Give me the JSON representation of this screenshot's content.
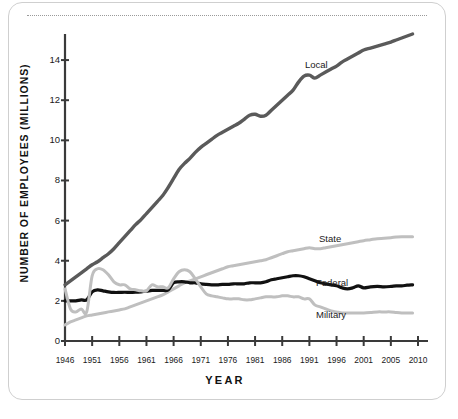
{
  "figure": {
    "axis_title_y": "NUMBER OF EMPLOYEES (MILLIONS)",
    "axis_title_x": "YEAR"
  },
  "chart_data": {
    "type": "line",
    "title": "",
    "xlabel": "YEAR",
    "ylabel": "NUMBER OF EMPLOYEES (MILLIONS)",
    "xlim": [
      1946,
      2010
    ],
    "ylim": [
      0,
      15
    ],
    "grid": false,
    "legend_position": "inline-right-of-lines",
    "x_ticks": [
      1946,
      1951,
      1956,
      1961,
      1966,
      1971,
      1976,
      1981,
      1986,
      1991,
      1996,
      2001,
      2005,
      2010
    ],
    "x_tick_labels": [
      "1946",
      "1951",
      "1956",
      "1961",
      "1966",
      "1971",
      "1976",
      "1981",
      "1986",
      "1991",
      "1996",
      "2001",
      "2005",
      "2010"
    ],
    "y_ticks": [
      0,
      2,
      4,
      6,
      8,
      10,
      12,
      14
    ],
    "y_tick_labels": [
      "0",
      "2",
      "4",
      "6",
      "8",
      "10",
      "12",
      "14"
    ],
    "colors": {
      "local": "#5a5a5a",
      "state": "#bfbfbf",
      "federal": "#111111",
      "military": "#bfbfbf",
      "axis": "#3a3a3a",
      "border": "#cfcfcf",
      "dotted_rule": "#9a9a9a"
    },
    "x": [
      1946,
      1947,
      1948,
      1949,
      1950,
      1951,
      1952,
      1953,
      1954,
      1955,
      1956,
      1957,
      1958,
      1959,
      1960,
      1961,
      1962,
      1963,
      1964,
      1965,
      1966,
      1967,
      1968,
      1969,
      1970,
      1971,
      1972,
      1973,
      1974,
      1975,
      1976,
      1977,
      1978,
      1979,
      1980,
      1981,
      1982,
      1983,
      1984,
      1985,
      1986,
      1987,
      1988,
      1989,
      1990,
      1991,
      1992,
      1993,
      1994,
      1995,
      1996,
      1997,
      1998,
      1999,
      2000,
      2001,
      2002,
      2003,
      2004,
      2005,
      2006,
      2007,
      2008,
      2009
    ],
    "series": [
      {
        "name": "Local",
        "color": "#5a5a5a",
        "label_text": "Local",
        "values": [
          2.8,
          3.0,
          3.2,
          3.4,
          3.6,
          3.75,
          3.9,
          4.1,
          4.3,
          4.6,
          4.9,
          5.2,
          5.5,
          5.75,
          6.0,
          6.3,
          6.6,
          6.9,
          7.2,
          7.6,
          8.1,
          8.5,
          8.8,
          9.0,
          9.4,
          9.6,
          9.8,
          10.0,
          10.2,
          10.4,
          10.6,
          10.7,
          10.9,
          11.1,
          11.3,
          11.3,
          11.2,
          11.2,
          11.4,
          11.7,
          12.0,
          12.3,
          12.6,
          13.0,
          13.4,
          13.5,
          13.6,
          13.7,
          13.9,
          14.1,
          14.3,
          14.6,
          14.8,
          15.1,
          15.4,
          15.7,
          16.0,
          16.2,
          16.4,
          16.7,
          16.9,
          17.1,
          17.3,
          17.5
        ],
        "axis_values_displayed": [
          2.8,
          3.0,
          3.2,
          3.4,
          3.6,
          3.8,
          3.95,
          4.15,
          4.35,
          4.6,
          4.9,
          5.2,
          5.5,
          5.8,
          6.05,
          6.35,
          6.65,
          6.95,
          7.25,
          7.65,
          8.1,
          8.55,
          8.85,
          9.1,
          9.4,
          9.65,
          9.85,
          10.05,
          10.25,
          10.4,
          10.55,
          10.7,
          10.85,
          11.05,
          11.25,
          11.3,
          11.2,
          11.25,
          11.5,
          11.75,
          12.0,
          12.25,
          12.5,
          12.9,
          13.2,
          13.25,
          13.1,
          13.25,
          13.4,
          13.55,
          13.7,
          13.9,
          14.05,
          14.2,
          14.35,
          14.5,
          14.6,
          14.7,
          14.8,
          14.9,
          15.0,
          15.1,
          15.2,
          15.3
        ]
      },
      {
        "name": "State",
        "color": "#bfbfbf",
        "label_text": "State",
        "values": [
          0.8,
          0.95,
          1.05,
          1.15,
          1.25,
          1.3,
          1.35,
          1.4,
          1.45,
          1.5,
          1.55,
          1.6,
          1.7,
          1.8,
          1.9,
          2.0,
          2.1,
          2.2,
          2.3,
          2.45,
          2.6,
          2.75,
          2.9,
          3.0,
          3.1,
          3.2,
          3.3,
          3.4,
          3.5,
          3.6,
          3.7,
          3.75,
          3.8,
          3.85,
          3.9,
          3.95,
          4.0,
          4.05,
          4.15,
          4.25,
          4.35,
          4.45,
          4.5,
          4.55,
          4.6,
          4.65,
          4.6,
          4.6,
          4.65,
          4.7,
          4.75,
          4.8,
          4.85,
          4.9,
          4.95,
          5.0,
          5.05,
          5.1,
          5.12,
          5.15,
          5.18,
          5.2,
          5.2,
          5.2
        ]
      },
      {
        "name": "Federal",
        "color": "#111111",
        "label_text": "Federal",
        "values": [
          2.0,
          2.0,
          2.0,
          2.05,
          2.05,
          2.45,
          2.55,
          2.5,
          2.45,
          2.42,
          2.42,
          2.43,
          2.42,
          2.43,
          2.45,
          2.48,
          2.52,
          2.52,
          2.52,
          2.55,
          2.9,
          2.95,
          2.95,
          2.9,
          2.9,
          2.85,
          2.82,
          2.8,
          2.8,
          2.82,
          2.82,
          2.85,
          2.85,
          2.85,
          2.9,
          2.9,
          2.9,
          2.95,
          3.05,
          3.1,
          3.15,
          3.2,
          3.25,
          3.25,
          3.2,
          3.1,
          3.0,
          2.9,
          2.85,
          2.8,
          2.75,
          2.65,
          2.6,
          2.65,
          2.75,
          2.65,
          2.7,
          2.72,
          2.7,
          2.72,
          2.75,
          2.75,
          2.78,
          2.8
        ]
      },
      {
        "name": "Military",
        "color": "#bfbfbf",
        "label_text": "Military",
        "values": [
          2.6,
          1.6,
          1.45,
          1.6,
          1.45,
          3.25,
          3.6,
          3.55,
          3.3,
          2.95,
          2.8,
          2.8,
          2.6,
          2.55,
          2.5,
          2.5,
          2.8,
          2.7,
          2.7,
          2.65,
          3.1,
          3.45,
          3.55,
          3.45,
          3.1,
          2.7,
          2.35,
          2.25,
          2.2,
          2.15,
          2.1,
          2.1,
          2.1,
          2.05,
          2.05,
          2.1,
          2.15,
          2.2,
          2.2,
          2.2,
          2.25,
          2.25,
          2.2,
          2.2,
          2.1,
          2.1,
          1.8,
          1.7,
          1.6,
          1.5,
          1.45,
          1.4,
          1.4,
          1.4,
          1.4,
          1.4,
          1.42,
          1.45,
          1.45,
          1.45,
          1.42,
          1.4,
          1.4,
          1.4
        ]
      }
    ]
  }
}
